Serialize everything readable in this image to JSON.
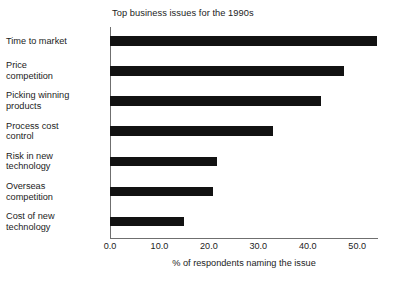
{
  "chart_data": {
    "type": "bar",
    "orientation": "horizontal",
    "title": "Top business issues for the 1990s",
    "xlabel": "% of respondents naming the issue",
    "ylabel": "",
    "xlim": [
      0.0,
      54.2
    ],
    "xticks": [
      "0.0",
      "10.0",
      "20.0",
      "30.0",
      "40.0",
      "50.0"
    ],
    "xtick_values": [
      0,
      10,
      20,
      30,
      40,
      50
    ],
    "grid": false,
    "legend": null,
    "bar_color": "#121212",
    "axis_color": "#6f6f6f",
    "categories": [
      "Time to market",
      "Price competition",
      "Picking winning products",
      "Process cost control",
      "Risk in new technology",
      "Overseas competition",
      "Cost of new technology"
    ],
    "category_lines": [
      [
        "Time to market"
      ],
      [
        "Price",
        "competition"
      ],
      [
        "Picking winning",
        "products"
      ],
      [
        "Process cost",
        "control"
      ],
      [
        "Risk in new",
        "technology"
      ],
      [
        "Overseas",
        "competition"
      ],
      [
        "Cost of new",
        "technology"
      ]
    ],
    "values": [
      54.0,
      47.4,
      42.7,
      33.0,
      21.7,
      20.9,
      15.0
    ]
  }
}
